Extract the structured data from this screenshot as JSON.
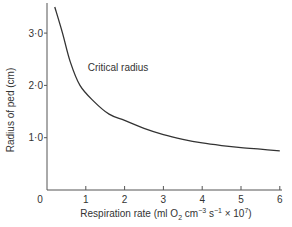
{
  "chart_data": {
    "type": "line",
    "title": "",
    "xlabel": "Respiration rate (ml O2 cm-3 s-1 × 10^7)",
    "xlabel_parts": {
      "pre": "Respiration rate (ml O",
      "sub": "2",
      "mid": " cm",
      "sup1": "−3",
      "mid2": " s",
      "sup2": "−1",
      "post": " × 10",
      "sup3": "7",
      "end": ")"
    },
    "ylabel": "Radius of ped (cm)",
    "xlim": [
      0,
      6
    ],
    "ylim": [
      0,
      3.6
    ],
    "x_ticks": [
      "0",
      "1",
      "2",
      "3",
      "4",
      "5",
      "6"
    ],
    "y_ticks": [
      "1·0",
      "2·0",
      "3·0"
    ],
    "grid": false,
    "annotations": [
      {
        "text": "Critical radius",
        "x": 1.05,
        "y": 2.35
      }
    ],
    "series": [
      {
        "name": "Critical radius",
        "x": [
          0.2,
          0.4,
          0.6,
          0.85,
          1.2,
          1.6,
          2.0,
          2.5,
          3.0,
          3.5,
          4.0,
          4.5,
          5.0,
          5.5,
          6.0
        ],
        "y": [
          3.5,
          3.0,
          2.45,
          2.0,
          1.7,
          1.45,
          1.33,
          1.18,
          1.06,
          0.97,
          0.9,
          0.85,
          0.81,
          0.78,
          0.75
        ]
      }
    ]
  }
}
